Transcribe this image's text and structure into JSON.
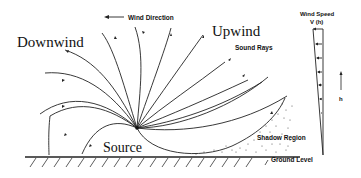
{
  "diagram": {
    "labels": {
      "downwind": "Downwind",
      "upwind": "Upwind",
      "wind_direction": "Wind Direction",
      "sound_rays": "Sound Rays",
      "source": "Source",
      "shadow_region": "Shadow Region",
      "ground_level": "Ground Level",
      "wind_speed_line1": "Wind Speed",
      "wind_speed_line2": "V (h)",
      "height_axis": "h"
    },
    "colors": {
      "ink": "#222222",
      "background": "#ffffff"
    }
  }
}
